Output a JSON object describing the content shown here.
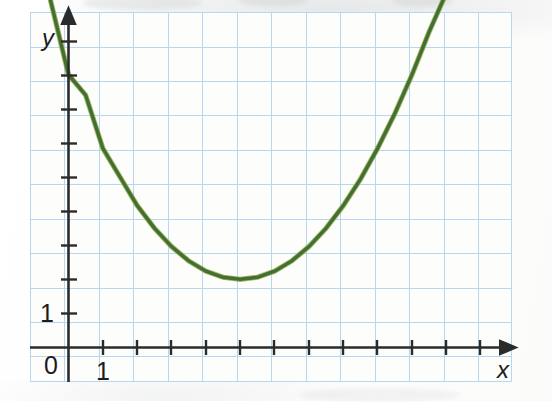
{
  "figure": {
    "kind": "hand-drawn-graph-on-grid-paper",
    "background_color": "#fbfbfa",
    "grid_color": "#a8cbe8",
    "grid_minor_color": "#c8dff2",
    "axis_color": "#2b2b2b",
    "curve_color": "#3f6b35",
    "curve_highlight_color": "#8fae3e"
  },
  "labels": {
    "origin": "0",
    "x_axis": "x",
    "y_axis": "y",
    "x_tick_label": "1",
    "y_tick_label": "1"
  },
  "chart_data": {
    "type": "line",
    "title": "",
    "subtitle": "",
    "xlabel": "x",
    "ylabel": "y",
    "grid": true,
    "legend": "none",
    "annotations": [],
    "xlim": [
      0,
      12.9
    ],
    "ylim": [
      0,
      10.5
    ],
    "x_ticks": [
      0,
      1,
      2,
      3,
      4,
      5,
      6,
      7,
      8,
      9,
      10,
      11,
      12
    ],
    "x_tick_labels": [
      "0",
      "1",
      "",
      "",
      "",
      "",
      "",
      "",
      "",
      "",
      "",
      "",
      ""
    ],
    "y_ticks": [
      0,
      1,
      2,
      3,
      4,
      5,
      6,
      7,
      8,
      9,
      10
    ],
    "y_tick_labels": [
      "0",
      "1",
      "",
      "",
      "",
      "",
      "",
      "",
      "",
      "",
      ""
    ],
    "series": [
      {
        "name": "parabola",
        "color": "#3f6b35",
        "vertex": [
          5,
          2
        ],
        "y_intercept": 8,
        "equation": "y = 0.24(x - 5)^2 + 2",
        "x": [
          -0.6,
          0,
          0.5,
          1,
          1.5,
          2,
          2.5,
          3,
          3.5,
          4,
          4.5,
          5,
          5.5,
          6,
          6.5,
          7,
          7.5,
          8,
          8.5,
          9,
          9.5,
          10,
          10.5,
          11,
          11.5,
          12,
          12.15
        ],
        "y": [
          10.5,
          8.0,
          7.4,
          5.84,
          5.0,
          4.16,
          3.5,
          2.96,
          2.54,
          2.24,
          2.06,
          2.0,
          2.06,
          2.24,
          2.54,
          2.96,
          3.5,
          4.16,
          4.94,
          5.84,
          6.86,
          8.0,
          9.26,
          10.4,
          10.5,
          10.5,
          10.5
        ]
      }
    ]
  }
}
